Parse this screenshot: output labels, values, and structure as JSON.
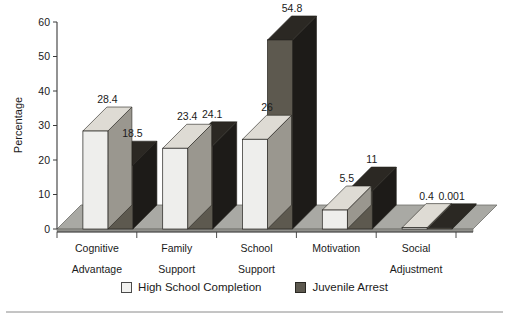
{
  "chart_data": {
    "type": "bar",
    "title": "",
    "subtitle": "",
    "xlabel": "",
    "ylabel": "Percentage",
    "ylim": [
      0,
      60
    ],
    "yticks": [
      "0",
      "10",
      "20",
      "30",
      "40",
      "50",
      "60"
    ],
    "grid": false,
    "legend_position": "bottom",
    "style": "3d-clustered-column",
    "categories": [
      "Cognitive Advantage",
      "Family Support",
      "School Support",
      "Motivation",
      "Social Adjustment"
    ],
    "category_lines": [
      [
        "Cognitive",
        "Advantage"
      ],
      [
        "Family",
        "Support"
      ],
      [
        "School",
        "Support"
      ],
      [
        "Motivation",
        ""
      ],
      [
        "Social",
        "Adjustment"
      ]
    ],
    "series": [
      {
        "name": "High School Completion",
        "color": "#eeeeec",
        "side_color": "#9a978f",
        "top_color": "#dedbd4",
        "values": [
          28.4,
          23.4,
          26,
          5.5,
          0.4
        ],
        "labels": [
          "28.4",
          "23.4",
          "26",
          "5.5",
          "0.4"
        ]
      },
      {
        "name": "Juvenile Arrest",
        "color": "#5d594f",
        "side_color": "#1d1b18",
        "top_color": "#2b2823",
        "values": [
          18.5,
          24.1,
          54.8,
          11,
          0.001
        ],
        "labels": [
          "18.5",
          "24.1",
          "54.8",
          "11",
          "0.001"
        ]
      }
    ]
  },
  "legend": {
    "items": [
      {
        "label": "High School Completion",
        "swatch": "#f2f2f0",
        "swatch_border": "#4a4a4a"
      },
      {
        "label": "Juvenile Arrest",
        "swatch": "#5d594f",
        "swatch_border": "#2a2823"
      }
    ]
  },
  "axes": {
    "y_title": "Percentage",
    "y_ticks": [
      "60",
      "50",
      "40",
      "30",
      "20",
      "10",
      "0"
    ]
  },
  "colors": {
    "floor": "#a9a9a4",
    "floor_edge": "#6e6e69",
    "axis_line": "#3a3a3a",
    "rule": "#8a8a8a",
    "background": "#ffffff"
  }
}
